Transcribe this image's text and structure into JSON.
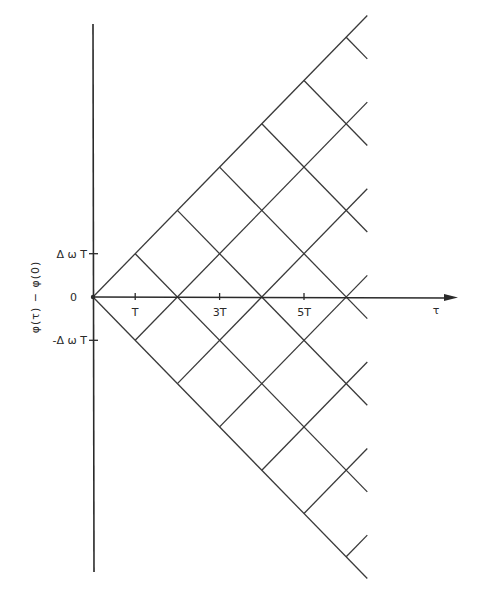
{
  "diagram": {
    "type": "phase-lattice",
    "x_axis": {
      "label": "τ",
      "unit": "T",
      "ticks": [
        {
          "value": 1,
          "label": "T"
        },
        {
          "value": 3,
          "label": "3T"
        },
        {
          "value": 5,
          "label": "5T"
        }
      ],
      "extent": 6.5
    },
    "y_axis": {
      "label": "φ(τ) − φ(0)",
      "unit": "ΔωT",
      "ticks": [
        {
          "value": 1,
          "label": "Δ ω T"
        },
        {
          "value": 0,
          "label": "0"
        },
        {
          "value": -1,
          "label": "-Δ ω T"
        }
      ],
      "extent": 6.5
    },
    "envelope": [
      {
        "name": "upper",
        "slope": 1
      },
      {
        "name": "lower",
        "slope": -1
      }
    ],
    "lattice_spacing": 2,
    "lattice_k": [
      1,
      2,
      3,
      4,
      5,
      6
    ],
    "line_color": "#3a3a3a"
  }
}
